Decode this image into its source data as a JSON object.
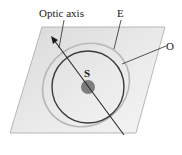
{
  "diagram": {
    "labels": {
      "optic_axis": "Optic axis",
      "extraordinary": "E",
      "ordinary": "O",
      "source": "S"
    },
    "colors": {
      "plane_fill": "#e6e6e6",
      "plane_edge": "#9a9a9a",
      "ordinary_wavefront": "#3a3a3a",
      "extraordinary_wavefront": "#b5b5b5",
      "source_dot": "#7d7d7d",
      "axis_line": "#2a2a2a"
    }
  }
}
